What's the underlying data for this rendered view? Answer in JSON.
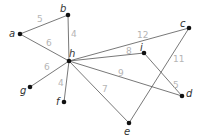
{
  "graph": {
    "nodes": [
      {
        "id": "a",
        "label": "a",
        "x": 20,
        "y": 34,
        "lx": 9,
        "ly": 37
      },
      {
        "id": "b",
        "label": "b",
        "x": 68,
        "y": 15,
        "lx": 60,
        "ly": 12
      },
      {
        "id": "c",
        "label": "c",
        "x": 189,
        "y": 28,
        "lx": 180,
        "ly": 27
      },
      {
        "id": "d",
        "label": "d",
        "x": 182,
        "y": 96,
        "lx": 186,
        "ly": 97
      },
      {
        "id": "e",
        "label": "e",
        "x": 129,
        "y": 123,
        "lx": 124,
        "ly": 135
      },
      {
        "id": "f",
        "label": "f",
        "x": 64,
        "y": 102,
        "lx": 56,
        "ly": 105
      },
      {
        "id": "g",
        "label": "g",
        "x": 30,
        "y": 87,
        "lx": 20,
        "ly": 94
      },
      {
        "id": "h",
        "label": "h",
        "x": 69,
        "y": 61,
        "lx": 69,
        "ly": 57
      },
      {
        "id": "i",
        "label": "i",
        "x": 144,
        "y": 53,
        "lx": 140,
        "ly": 51
      }
    ],
    "edges": [
      {
        "from": "a",
        "to": "b",
        "weight": "5",
        "lx": 37,
        "ly": 22
      },
      {
        "from": "a",
        "to": "h",
        "weight": "6",
        "lx": 46,
        "ly": 46
      },
      {
        "from": "b",
        "to": "h",
        "weight": "4",
        "lx": 71,
        "ly": 37
      },
      {
        "from": "h",
        "to": "g",
        "weight": "6",
        "lx": 44,
        "ly": 70
      },
      {
        "from": "h",
        "to": "f",
        "weight": "4",
        "lx": 58,
        "ly": 86
      },
      {
        "from": "h",
        "to": "c",
        "weight": "12",
        "lx": 137,
        "ly": 38
      },
      {
        "from": "h",
        "to": "i",
        "weight": "8",
        "lx": 126,
        "ly": 54
      },
      {
        "from": "h",
        "to": "d",
        "weight": "9",
        "lx": 118,
        "ly": 76
      },
      {
        "from": "h",
        "to": "e",
        "weight": "7",
        "lx": 102,
        "ly": 92
      },
      {
        "from": "c",
        "to": "e",
        "weight": "11",
        "lx": 173,
        "ly": 62
      },
      {
        "from": "i",
        "to": "d",
        "weight": "5",
        "lx": 173,
        "ly": 88
      }
    ]
  }
}
